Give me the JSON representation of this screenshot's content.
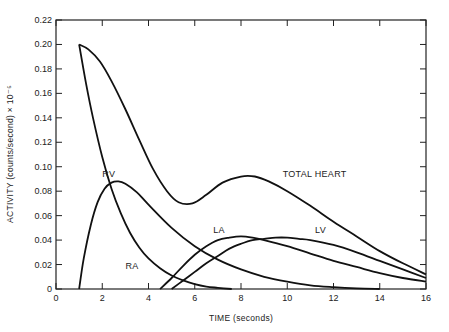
{
  "chart_data": {
    "type": "line",
    "title": "",
    "xlabel": "TIME (seconds)",
    "ylabel": "ACTIVITY (counts/second) × 10⁻⁵",
    "xlim": [
      0,
      16
    ],
    "ylim": [
      0,
      0.22
    ],
    "grid": false,
    "legend": "inline labels",
    "x_ticks": [
      0,
      2,
      4,
      6,
      8,
      10,
      12,
      14,
      16
    ],
    "x_tick_labels": [
      "0",
      "2",
      "4",
      "6",
      "8",
      "10",
      "12",
      "14",
      "16"
    ],
    "y_ticks": [
      0,
      0.02,
      0.04,
      0.06,
      0.08,
      0.1,
      0.12,
      0.14,
      0.16,
      0.18,
      0.2,
      0.22
    ],
    "y_tick_labels": [
      "0",
      "0.02",
      "0.04",
      "0.06",
      "0.08",
      "0.10",
      "0.12",
      "0.14",
      "0.16",
      "0.18",
      "0.20",
      "0.22"
    ],
    "series": [
      {
        "name": "TOTAL HEART",
        "label_pos": [
          9.8,
          0.092
        ],
        "x": [
          1.0,
          1.4,
          1.9,
          2.4,
          3.0,
          3.6,
          4.2,
          4.8,
          5.3,
          5.9,
          6.5,
          7.2,
          8.0,
          8.6,
          9.2,
          10.0,
          11.0,
          12.0,
          13.0,
          14.0,
          15.0,
          16.0
        ],
        "y": [
          0.2,
          0.196,
          0.186,
          0.17,
          0.147,
          0.122,
          0.098,
          0.08,
          0.071,
          0.07,
          0.077,
          0.087,
          0.092,
          0.092,
          0.088,
          0.08,
          0.068,
          0.055,
          0.043,
          0.031,
          0.021,
          0.012
        ]
      },
      {
        "name": "RV",
        "label_pos": [
          2.0,
          0.092
        ],
        "x": [
          1.0,
          1.2,
          1.5,
          1.8,
          2.1,
          2.4,
          2.7,
          3.0,
          3.5,
          4.0,
          5.0,
          6.0,
          7.0,
          8.0,
          9.0,
          10.0,
          11.0,
          12.0,
          13.0,
          14.0
        ],
        "y": [
          0.0,
          0.025,
          0.052,
          0.071,
          0.082,
          0.087,
          0.088,
          0.086,
          0.079,
          0.069,
          0.05,
          0.035,
          0.024,
          0.016,
          0.01,
          0.006,
          0.003,
          0.0015,
          0.0005,
          0.0
        ]
      },
      {
        "name": "RA",
        "label_pos": [
          3.0,
          0.016
        ],
        "x": [
          1.0,
          1.3,
          1.6,
          2.0,
          2.4,
          2.8,
          3.2,
          3.6,
          4.0,
          4.5,
          5.0,
          5.5,
          6.0,
          6.5,
          7.0,
          7.6
        ],
        "y": [
          0.2,
          0.168,
          0.14,
          0.108,
          0.082,
          0.062,
          0.046,
          0.034,
          0.025,
          0.017,
          0.011,
          0.007,
          0.004,
          0.002,
          0.001,
          0.0
        ]
      },
      {
        "name": "LA",
        "label_pos": [
          6.8,
          0.046
        ],
        "x": [
          4.5,
          5.0,
          5.5,
          6.0,
          6.5,
          7.0,
          7.5,
          8.0,
          8.5,
          9.0,
          10.0,
          11.0,
          12.0,
          13.0,
          14.0,
          15.0,
          16.0
        ],
        "y": [
          0.0,
          0.009,
          0.019,
          0.028,
          0.035,
          0.04,
          0.042,
          0.043,
          0.042,
          0.04,
          0.035,
          0.029,
          0.023,
          0.018,
          0.013,
          0.009,
          0.006
        ]
      },
      {
        "name": "LV",
        "label_pos": [
          11.2,
          0.046
        ],
        "x": [
          5.0,
          5.5,
          6.0,
          6.5,
          7.0,
          7.5,
          8.0,
          8.5,
          9.0,
          9.5,
          10.0,
          10.5,
          11.0,
          12.0,
          13.0,
          14.0,
          15.0,
          16.0
        ],
        "y": [
          0.0,
          0.007,
          0.014,
          0.021,
          0.027,
          0.033,
          0.037,
          0.04,
          0.041,
          0.042,
          0.042,
          0.041,
          0.04,
          0.036,
          0.03,
          0.023,
          0.016,
          0.009
        ]
      }
    ]
  },
  "style": {
    "line_color": "#111111",
    "axis_color": "#222222",
    "background": "#ffffff"
  }
}
